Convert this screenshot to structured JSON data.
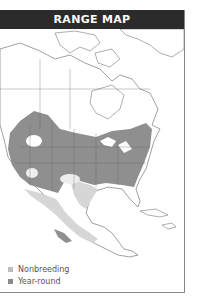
{
  "header": {
    "title": "RANGE MAP"
  },
  "legend": {
    "items": [
      {
        "label": "Nonbreeding",
        "color": "#bdbdbd"
      },
      {
        "label": "Year-round",
        "color": "#8a8a8a"
      }
    ]
  },
  "colors": {
    "title_bg": "#2b2b2b",
    "nonbreeding": "#d6d6d6",
    "year_round": "#8f8f8f",
    "land_outline": "#777777"
  }
}
